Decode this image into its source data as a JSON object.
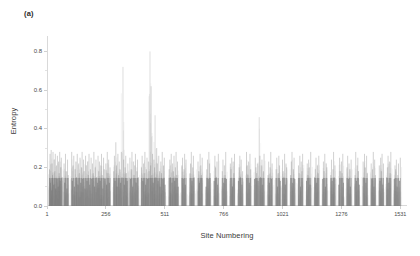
{
  "figure": {
    "panel_label": "(a)",
    "background_color": "#ffffff",
    "axis_color": "#d9d9d9",
    "spike_color": "#808080"
  },
  "chart_data": {
    "type": "bar",
    "title": "",
    "subtitle": "",
    "xlabel": "Site Numbering",
    "ylabel": "Entropy",
    "xlim": [
      1,
      1560
    ],
    "ylim": [
      0.0,
      0.88
    ],
    "grid": false,
    "legend": null,
    "annotations": [
      "(a)"
    ],
    "x_ticks": [
      1,
      256,
      511,
      766,
      1021,
      1276,
      1531
    ],
    "x_tick_labels": [
      "1",
      "256",
      "511",
      "766",
      "1021",
      "1276",
      "1531"
    ],
    "y_ticks": [
      0.0,
      0.2,
      0.4,
      0.6,
      0.8
    ],
    "y_tick_labels": [
      "0.0",
      "0.2",
      "0.4",
      "0.6",
      "0.8"
    ],
    "y_minor_ticks": [
      0.1,
      0.3,
      0.5,
      0.7
    ],
    "series_name": "Shannon entropy per site",
    "notable_peaks": [
      {
        "x": 330,
        "y": 0.72
      },
      {
        "x": 447,
        "y": 0.8
      },
      {
        "x": 452,
        "y": 0.62
      },
      {
        "x": 469,
        "y": 0.47
      },
      {
        "x": 920,
        "y": 0.46
      },
      {
        "x": 300,
        "y": 0.33
      },
      {
        "x": 476,
        "y": 0.3
      }
    ],
    "points": [
      [
        12,
        0.19
      ],
      [
        14,
        0.27
      ],
      [
        16,
        0.12
      ],
      [
        19,
        0.29
      ],
      [
        21,
        0.08
      ],
      [
        23,
        0.22
      ],
      [
        25,
        0.16
      ],
      [
        27,
        0.28
      ],
      [
        30,
        0.11
      ],
      [
        32,
        0.24
      ],
      [
        35,
        0.18
      ],
      [
        37,
        0.27
      ],
      [
        39,
        0.09
      ],
      [
        42,
        0.21
      ],
      [
        44,
        0.14
      ],
      [
        46,
        0.26
      ],
      [
        49,
        0.1
      ],
      [
        51,
        0.23
      ],
      [
        54,
        0.17
      ],
      [
        56,
        0.28
      ],
      [
        58,
        0.13
      ],
      [
        61,
        0.2
      ],
      [
        63,
        0.25
      ],
      [
        66,
        0.15
      ],
      [
        75,
        0.22
      ],
      [
        78,
        0.12
      ],
      [
        81,
        0.27
      ],
      [
        84,
        0.18
      ],
      [
        87,
        0.09
      ],
      [
        90,
        0.24
      ],
      [
        93,
        0.16
      ],
      [
        108,
        0.28
      ],
      [
        111,
        0.13
      ],
      [
        114,
        0.21
      ],
      [
        117,
        0.26
      ],
      [
        120,
        0.1
      ],
      [
        123,
        0.19
      ],
      [
        126,
        0.23
      ],
      [
        129,
        0.15
      ],
      [
        132,
        0.27
      ],
      [
        135,
        0.11
      ],
      [
        138,
        0.22
      ],
      [
        141,
        0.17
      ],
      [
        144,
        0.25
      ],
      [
        147,
        0.12
      ],
      [
        150,
        0.2
      ],
      [
        153,
        0.28
      ],
      [
        156,
        0.14
      ],
      [
        159,
        0.24
      ],
      [
        162,
        0.18
      ],
      [
        165,
        0.09
      ],
      [
        168,
        0.26
      ],
      [
        171,
        0.21
      ],
      [
        174,
        0.13
      ],
      [
        177,
        0.23
      ],
      [
        180,
        0.16
      ],
      [
        183,
        0.27
      ],
      [
        186,
        0.11
      ],
      [
        189,
        0.19
      ],
      [
        192,
        0.25
      ],
      [
        195,
        0.14
      ],
      [
        198,
        0.22
      ],
      [
        201,
        0.17
      ],
      [
        204,
        0.28
      ],
      [
        207,
        0.1
      ],
      [
        210,
        0.2
      ],
      [
        213,
        0.24
      ],
      [
        216,
        0.15
      ],
      [
        219,
        0.12
      ],
      [
        222,
        0.26
      ],
      [
        225,
        0.18
      ],
      [
        228,
        0.23
      ],
      [
        231,
        0.13
      ],
      [
        234,
        0.21
      ],
      [
        237,
        0.27
      ],
      [
        240,
        0.16
      ],
      [
        243,
        0.09
      ],
      [
        246,
        0.25
      ],
      [
        249,
        0.19
      ],
      [
        252,
        0.14
      ],
      [
        256,
        0.22
      ],
      [
        259,
        0.11
      ],
      [
        262,
        0.28
      ],
      [
        265,
        0.17
      ],
      [
        268,
        0.24
      ],
      [
        271,
        0.12
      ],
      [
        274,
        0.2
      ],
      [
        290,
        0.18
      ],
      [
        293,
        0.26
      ],
      [
        296,
        0.13
      ],
      [
        299,
        0.33
      ],
      [
        302,
        0.21
      ],
      [
        305,
        0.1
      ],
      [
        308,
        0.27
      ],
      [
        311,
        0.16
      ],
      [
        314,
        0.23
      ],
      [
        317,
        0.19
      ],
      [
        320,
        0.12
      ],
      [
        323,
        0.28
      ],
      [
        326,
        0.15
      ],
      [
        330,
        0.72
      ],
      [
        333,
        0.24
      ],
      [
        336,
        0.11
      ],
      [
        339,
        0.2
      ],
      [
        342,
        0.26
      ],
      [
        345,
        0.17
      ],
      [
        348,
        0.13
      ],
      [
        351,
        0.22
      ],
      [
        360,
        0.25
      ],
      [
        363,
        0.14
      ],
      [
        366,
        0.19
      ],
      [
        369,
        0.28
      ],
      [
        372,
        0.1
      ],
      [
        375,
        0.23
      ],
      [
        378,
        0.16
      ],
      [
        381,
        0.21
      ],
      [
        384,
        0.27
      ],
      [
        387,
        0.12
      ],
      [
        390,
        0.18
      ],
      [
        393,
        0.24
      ],
      [
        396,
        0.15
      ],
      [
        410,
        0.2
      ],
      [
        413,
        0.26
      ],
      [
        416,
        0.13
      ],
      [
        419,
        0.22
      ],
      [
        422,
        0.17
      ],
      [
        425,
        0.28
      ],
      [
        428,
        0.11
      ],
      [
        431,
        0.19
      ],
      [
        434,
        0.25
      ],
      [
        437,
        0.14
      ],
      [
        440,
        0.23
      ],
      [
        443,
        0.18
      ],
      [
        447,
        0.8
      ],
      [
        450,
        0.21
      ],
      [
        452,
        0.62
      ],
      [
        455,
        0.16
      ],
      [
        458,
        0.27
      ],
      [
        461,
        0.12
      ],
      [
        464,
        0.24
      ],
      [
        467,
        0.2
      ],
      [
        469,
        0.47
      ],
      [
        472,
        0.15
      ],
      [
        476,
        0.3
      ],
      [
        479,
        0.22
      ],
      [
        482,
        0.13
      ],
      [
        485,
        0.26
      ],
      [
        488,
        0.18
      ],
      [
        491,
        0.1
      ],
      [
        494,
        0.23
      ],
      [
        497,
        0.17
      ],
      [
        500,
        0.28
      ],
      [
        503,
        0.14
      ],
      [
        506,
        0.21
      ],
      [
        509,
        0.25
      ],
      [
        512,
        0.11
      ],
      [
        530,
        0.19
      ],
      [
        533,
        0.24
      ],
      [
        536,
        0.15
      ],
      [
        539,
        0.27
      ],
      [
        542,
        0.12
      ],
      [
        545,
        0.22
      ],
      [
        548,
        0.18
      ],
      [
        551,
        0.26
      ],
      [
        554,
        0.13
      ],
      [
        557,
        0.2
      ],
      [
        560,
        0.28
      ],
      [
        563,
        0.16
      ],
      [
        566,
        0.23
      ],
      [
        569,
        0.1
      ],
      [
        585,
        0.21
      ],
      [
        588,
        0.25
      ],
      [
        591,
        0.14
      ],
      [
        594,
        0.19
      ],
      [
        597,
        0.27
      ],
      [
        600,
        0.11
      ],
      [
        603,
        0.24
      ],
      [
        620,
        0.17
      ],
      [
        623,
        0.22
      ],
      [
        626,
        0.28
      ],
      [
        629,
        0.13
      ],
      [
        632,
        0.2
      ],
      [
        635,
        0.26
      ],
      [
        638,
        0.15
      ],
      [
        655,
        0.23
      ],
      [
        658,
        0.18
      ],
      [
        661,
        0.12
      ],
      [
        664,
        0.27
      ],
      [
        667,
        0.21
      ],
      [
        670,
        0.16
      ],
      [
        673,
        0.25
      ],
      [
        690,
        0.1
      ],
      [
        693,
        0.19
      ],
      [
        696,
        0.24
      ],
      [
        699,
        0.14
      ],
      [
        702,
        0.28
      ],
      [
        705,
        0.22
      ],
      [
        708,
        0.17
      ],
      [
        725,
        0.13
      ],
      [
        728,
        0.26
      ],
      [
        731,
        0.2
      ],
      [
        734,
        0.15
      ],
      [
        737,
        0.23
      ],
      [
        740,
        0.11
      ],
      [
        743,
        0.27
      ],
      [
        760,
        0.18
      ],
      [
        763,
        0.24
      ],
      [
        766,
        0.12
      ],
      [
        769,
        0.21
      ],
      [
        772,
        0.16
      ],
      [
        775,
        0.28
      ],
      [
        778,
        0.14
      ],
      [
        795,
        0.22
      ],
      [
        798,
        0.19
      ],
      [
        801,
        0.25
      ],
      [
        804,
        0.1
      ],
      [
        807,
        0.23
      ],
      [
        810,
        0.17
      ],
      [
        813,
        0.27
      ],
      [
        830,
        0.13
      ],
      [
        833,
        0.2
      ],
      [
        836,
        0.26
      ],
      [
        839,
        0.15
      ],
      [
        842,
        0.24
      ],
      [
        845,
        0.11
      ],
      [
        848,
        0.18
      ],
      [
        865,
        0.28
      ],
      [
        868,
        0.21
      ],
      [
        871,
        0.16
      ],
      [
        874,
        0.23
      ],
      [
        877,
        0.12
      ],
      [
        880,
        0.27
      ],
      [
        883,
        0.19
      ],
      [
        900,
        0.14
      ],
      [
        903,
        0.25
      ],
      [
        906,
        0.2
      ],
      [
        909,
        0.17
      ],
      [
        912,
        0.22
      ],
      [
        915,
        0.13
      ],
      [
        920,
        0.46
      ],
      [
        923,
        0.26
      ],
      [
        926,
        0.15
      ],
      [
        929,
        0.21
      ],
      [
        932,
        0.24
      ],
      [
        935,
        0.11
      ],
      [
        938,
        0.18
      ],
      [
        941,
        0.27
      ],
      [
        958,
        0.16
      ],
      [
        961,
        0.23
      ],
      [
        964,
        0.12
      ],
      [
        967,
        0.2
      ],
      [
        970,
        0.28
      ],
      [
        973,
        0.14
      ],
      [
        976,
        0.22
      ],
      [
        993,
        0.19
      ],
      [
        996,
        0.25
      ],
      [
        999,
        0.1
      ],
      [
        1002,
        0.17
      ],
      [
        1005,
        0.26
      ],
      [
        1008,
        0.21
      ],
      [
        1011,
        0.13
      ],
      [
        1021,
        0.24
      ],
      [
        1024,
        0.18
      ],
      [
        1027,
        0.15
      ],
      [
        1030,
        0.27
      ],
      [
        1033,
        0.11
      ],
      [
        1036,
        0.22
      ],
      [
        1039,
        0.2
      ],
      [
        1056,
        0.16
      ],
      [
        1059,
        0.23
      ],
      [
        1062,
        0.28
      ],
      [
        1065,
        0.12
      ],
      [
        1068,
        0.19
      ],
      [
        1071,
        0.25
      ],
      [
        1074,
        0.14
      ],
      [
        1090,
        0.21
      ],
      [
        1093,
        0.17
      ],
      [
        1096,
        0.26
      ],
      [
        1099,
        0.1
      ],
      [
        1102,
        0.23
      ],
      [
        1105,
        0.18
      ],
      [
        1108,
        0.27
      ],
      [
        1125,
        0.13
      ],
      [
        1128,
        0.22
      ],
      [
        1131,
        0.16
      ],
      [
        1134,
        0.24
      ],
      [
        1137,
        0.2
      ],
      [
        1140,
        0.11
      ],
      [
        1143,
        0.28
      ],
      [
        1160,
        0.15
      ],
      [
        1163,
        0.19
      ],
      [
        1166,
        0.25
      ],
      [
        1169,
        0.12
      ],
      [
        1172,
        0.21
      ],
      [
        1175,
        0.17
      ],
      [
        1178,
        0.26
      ],
      [
        1195,
        0.14
      ],
      [
        1198,
        0.23
      ],
      [
        1201,
        0.18
      ],
      [
        1204,
        0.27
      ],
      [
        1207,
        0.1
      ],
      [
        1210,
        0.22
      ],
      [
        1213,
        0.2
      ],
      [
        1230,
        0.16
      ],
      [
        1233,
        0.24
      ],
      [
        1236,
        0.13
      ],
      [
        1239,
        0.19
      ],
      [
        1242,
        0.28
      ],
      [
        1245,
        0.15
      ],
      [
        1248,
        0.21
      ],
      [
        1265,
        0.11
      ],
      [
        1268,
        0.25
      ],
      [
        1271,
        0.18
      ],
      [
        1276,
        0.23
      ],
      [
        1279,
        0.17
      ],
      [
        1282,
        0.27
      ],
      [
        1285,
        0.12
      ],
      [
        1300,
        0.2
      ],
      [
        1303,
        0.26
      ],
      [
        1306,
        0.14
      ],
      [
        1309,
        0.22
      ],
      [
        1312,
        0.19
      ],
      [
        1315,
        0.1
      ],
      [
        1318,
        0.24
      ],
      [
        1335,
        0.16
      ],
      [
        1338,
        0.28
      ],
      [
        1341,
        0.13
      ],
      [
        1344,
        0.21
      ],
      [
        1347,
        0.25
      ],
      [
        1350,
        0.18
      ],
      [
        1353,
        0.11
      ],
      [
        1370,
        0.23
      ],
      [
        1373,
        0.15
      ],
      [
        1376,
        0.27
      ],
      [
        1379,
        0.2
      ],
      [
        1382,
        0.12
      ],
      [
        1385,
        0.26
      ],
      [
        1388,
        0.17
      ],
      [
        1405,
        0.22
      ],
      [
        1408,
        0.14
      ],
      [
        1411,
        0.19
      ],
      [
        1414,
        0.28
      ],
      [
        1417,
        0.1
      ],
      [
        1420,
        0.24
      ],
      [
        1423,
        0.16
      ],
      [
        1440,
        0.21
      ],
      [
        1443,
        0.13
      ],
      [
        1446,
        0.25
      ],
      [
        1449,
        0.18
      ],
      [
        1452,
        0.27
      ],
      [
        1455,
        0.11
      ],
      [
        1458,
        0.22
      ],
      [
        1472,
        0.15
      ],
      [
        1475,
        0.2
      ],
      [
        1478,
        0.26
      ],
      [
        1481,
        0.12
      ],
      [
        1484,
        0.23
      ],
      [
        1487,
        0.17
      ],
      [
        1490,
        0.28
      ],
      [
        1505,
        0.14
      ],
      [
        1508,
        0.21
      ],
      [
        1511,
        0.19
      ],
      [
        1514,
        0.24
      ],
      [
        1517,
        0.1
      ],
      [
        1520,
        0.16
      ],
      [
        1523,
        0.22
      ],
      [
        1528,
        0.13
      ],
      [
        1531,
        0.25
      ]
    ]
  }
}
